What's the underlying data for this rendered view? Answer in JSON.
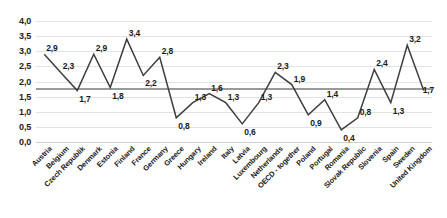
{
  "chart_data": {
    "type": "line",
    "title": "",
    "subtitle": "",
    "xlabel": "",
    "ylabel": "",
    "ylim": [
      0.0,
      4.0
    ],
    "ytick_labels": [
      "4,0",
      "3,5",
      "3,0",
      "2,5",
      "2,0",
      "1,5",
      "1,0",
      "0,5",
      "0,0"
    ],
    "ytick_values": [
      4.0,
      3.5,
      3.0,
      2.5,
      2.0,
      1.5,
      1.0,
      0.5,
      0.0
    ],
    "grid": true,
    "legend": "none",
    "reference_line": {
      "value": 1.8,
      "color": "#9a9a9a",
      "label": ""
    },
    "series_color": "#3f3f3f",
    "marker": "none",
    "categories": [
      "Austria",
      "Belgium",
      "Czech Republik",
      "Denmark",
      "Estonia",
      "Finland",
      "France",
      "Germany",
      "Greece",
      "Hungary",
      "Ireland",
      "Italy",
      "Latvia",
      "Luxembourg",
      "Netherlands",
      "OECD - together",
      "Poland",
      "Portugal",
      "Romania",
      "Slovak Republic",
      "Slovenia",
      "Spain",
      "Sweden",
      "United Kingdom"
    ],
    "values": [
      2.9,
      2.3,
      1.7,
      2.9,
      1.8,
      3.4,
      2.2,
      2.8,
      0.8,
      1.3,
      1.6,
      1.3,
      0.6,
      1.3,
      2.3,
      1.9,
      0.9,
      1.4,
      0.4,
      0.8,
      2.4,
      1.3,
      3.2,
      1.7
    ],
    "data_labels": [
      "2,9",
      "2,3",
      "1,7",
      "2,9",
      "1,8",
      "3,4",
      "2,2",
      "2,8",
      "0,8",
      "1,3",
      "1,6",
      "1,3",
      "0,6",
      "1,3",
      "2,3",
      "1,9",
      "0,9",
      "1,4",
      "0,4",
      "0,8",
      "2,4",
      "1,3",
      "3,2",
      "1,7"
    ]
  }
}
